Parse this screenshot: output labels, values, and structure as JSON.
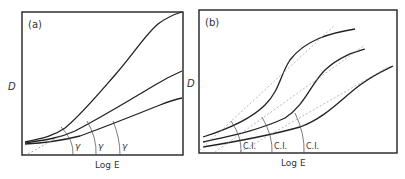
{
  "figure": {
    "panels": [
      {
        "id": "a",
        "label": "(a)",
        "ylabel": "D",
        "xlabel": "Log E",
        "curve_annotation": "γ",
        "curves": [
          "high contrast curve",
          "medium contrast curve",
          "low contrast curve"
        ],
        "annotations": [
          "γ",
          "γ",
          "γ"
        ]
      },
      {
        "id": "b",
        "label": "(b)",
        "ylabel": "D",
        "xlabel": "Log E",
        "curve_annotation": "C.I.",
        "curves": [
          "curve 1",
          "curve 2",
          "curve 3"
        ],
        "annotations": [
          "C.I.",
          "C.I.",
          "C.I."
        ]
      }
    ]
  }
}
